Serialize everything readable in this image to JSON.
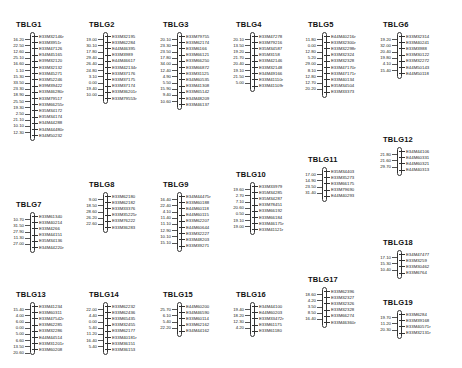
{
  "groups": [
    {
      "name": "TBLG1",
      "x": 30,
      "y": 22,
      "markers": [
        "E33M32146r",
        "E33M3951r",
        "E33M47126",
        "E34M45165",
        "E39M32120",
        "E33M32132",
        "E33M45271",
        "E33M52246",
        "E39M39422",
        "E33M46280r",
        "E33M79517",
        "E33M66255r",
        "E35M34172",
        "E35M34174",
        "E34M44288",
        "E34M44480r",
        "E34M50232"
      ],
      "distances": [
        "16.20",
        "22.50",
        "12.60",
        "25.10",
        "16.60",
        "1.10",
        "15.30",
        "33.50",
        "23.30",
        "18.90",
        "25.50",
        "19.30",
        "2.50",
        "21.10",
        "10.10",
        "12.30"
      ]
    },
    {
      "name": "TBLG2",
      "x": 103,
      "y": 22,
      "markers": [
        "E33M32195",
        "E33M62284",
        "E44M46395",
        "E33M3989",
        "E44M46617",
        "E33M42134r",
        "E33M37176",
        "E33M37175",
        "E33M37174",
        "E33M36201r",
        "E33M79553r"
      ],
      "distances": [
        "19.00",
        "30.10",
        "17.80",
        "29.40",
        "26.40",
        "24.80",
        "3.10",
        "0.00",
        "19.40",
        "10.00"
      ]
    },
    {
      "name": "TBLG3",
      "x": 177,
      "y": 22,
      "markers": [
        "E33M79755",
        "E33M62174",
        "E33M6166",
        "E33M66121",
        "E33M66250",
        "E33M66872",
        "E33M31125",
        "E34M60535",
        "E33M41308",
        "E33M65142",
        "E34M48209",
        "E33M46137"
      ],
      "distances": [
        "20.10",
        "23.30",
        "23.50",
        "17.80",
        "34.00",
        "12.40",
        "4.90",
        "5.50",
        "15.90",
        "9.40",
        "10.60"
      ]
    },
    {
      "name": "TBLG4",
      "x": 250,
      "y": 22,
      "markers": [
        "E33M47278",
        "E33M79216",
        "E35M34587",
        "E35M3158",
        "E33M42146",
        "E33M32148",
        "E34M49166",
        "E33M41110r",
        "E33M41109r"
      ],
      "distances": [
        "20.10",
        "13.50",
        "19.20",
        "21.70",
        "20.40",
        "19.10",
        "21.50",
        "5.00"
      ]
    },
    {
      "name": "TBLG5",
      "x": 322,
      "y": 22,
      "markers": [
        "E44M40216r",
        "E33M32300r",
        "E33M32298r",
        "E33M32324",
        "E33M32328",
        "E33M47170r",
        "E33M47171r",
        "E33M40134",
        "E35M34504",
        "E33M33373"
      ],
      "distances": [
        "11.80",
        "0.00",
        "12.80",
        "5.20",
        "29.00",
        "8.10",
        "12.80",
        "12.70",
        "20.20"
      ]
    },
    {
      "name": "TBLG6",
      "x": 397,
      "y": 22,
      "markers": [
        "E33M32314",
        "E33M40241",
        "E33M3988",
        "E33M30122",
        "E33M32272",
        "E44M50143",
        "E44M50118"
      ],
      "distances": [
        "19.20",
        "32.00",
        "20.40",
        "19.80",
        "4.10",
        "15.40"
      ]
    },
    {
      "name": "TBLG7",
      "x": 30,
      "y": 202,
      "markers": [
        "E33M61340",
        "E33M40214",
        "E33M4266",
        "E33M44151",
        "E35M34136",
        "E34M44220r"
      ],
      "distances": [
        "10.70",
        "31.50",
        "27.90",
        "11.30",
        "27.00"
      ]
    },
    {
      "name": "TBLG8",
      "x": 103,
      "y": 182,
      "markers": [
        "E33M62180",
        "E33M62182",
        "E33M33376",
        "E33M35225r",
        "E33M76222",
        "E33M36283"
      ],
      "distances": [
        "9.00",
        "18.50",
        "28.60",
        "26.20",
        "22.60"
      ]
    },
    {
      "name": "TBLG9",
      "x": 177,
      "y": 182,
      "markers": [
        "E34M44475r",
        "E33M60188",
        "E44M60118",
        "E44M60115",
        "E33M62207",
        "E44M60644",
        "E33M32227",
        "E33M48203",
        "E33M39271"
      ],
      "distances": [
        "16.40",
        "22.40",
        "4.10",
        "11.40",
        "11.10",
        "12.90",
        "10.10",
        "15.10"
      ]
    },
    {
      "name": "TBLG10",
      "x": 250,
      "y": 172,
      "markers": [
        "E33M33979",
        "E35M34285",
        "E35M34287",
        "E33M78451",
        "E33M66192",
        "E33M66184",
        "E33M46175r",
        "E33M41121r"
      ],
      "distances": [
        "19.60",
        "2.70",
        "7.10",
        "20.60",
        "0.50",
        "19.10",
        "19.00"
      ]
    },
    {
      "name": "TBLG11",
      "x": 322,
      "y": 157,
      "markers": [
        "E35M34403",
        "E33M35273",
        "E33M66175",
        "E33M79690",
        "E44M40293"
      ],
      "distances": [
        "17.00",
        "14.90",
        "23.50",
        "31.40"
      ]
    },
    {
      "name": "TBLG12",
      "x": 397,
      "y": 137,
      "markers": [
        "E34M44106",
        "E44M60331",
        "E44M60321",
        "E44M40313"
      ],
      "distances": [
        "21.80",
        "21.60",
        "29.70"
      ]
    },
    {
      "name": "TBLG13",
      "x": 30,
      "y": 292,
      "markers": [
        "E33M41234",
        "E33M60311",
        "E33M47542r",
        "E33M62285",
        "E33M32286",
        "E44M44514",
        "E33M31201r",
        "E33M60208"
      ],
      "distances": [
        "15.40",
        "4.00",
        "6.00",
        "0.00",
        "5.00",
        "6.60",
        "13.50",
        "20.60"
      ]
    },
    {
      "name": "TBLG14",
      "x": 103,
      "y": 292,
      "markers": [
        "E33M62232",
        "E33M62436",
        "E33M65435",
        "E33M32455",
        "E33M62177",
        "E33M40181r",
        "E33M36151",
        "E33M36153"
      ],
      "distances": [
        "22.00",
        "4.40",
        "0.00",
        "5.40",
        "11.20",
        "16.40",
        "5.40"
      ]
    },
    {
      "name": "TBLG15",
      "x": 177,
      "y": 292,
      "markers": [
        "E44M60200",
        "E34M46590",
        "E33M60114",
        "E33M62162",
        "E34M44162"
      ],
      "distances": [
        "25.70",
        "6.10",
        "5.40",
        "22.20"
      ]
    },
    {
      "name": "TBLG16",
      "x": 250,
      "y": 292,
      "markers": [
        "E34M44100",
        "E44M60203",
        "E33M33472r",
        "E33M61175",
        "E33M61180"
      ],
      "distances": [
        "19.40",
        "18.20",
        "12.30",
        "4.20"
      ]
    },
    {
      "name": "TBLG17",
      "x": 322,
      "y": 277,
      "markers": [
        "E33M62396",
        "E33M32327",
        "E33M32326",
        "E33M32328",
        "E33M66274",
        "E33M46360r"
      ],
      "distances": [
        "18.60",
        "4.20",
        "3.50",
        "8.50",
        "16.40"
      ]
    },
    {
      "name": "TBLG18",
      "x": 397,
      "y": 240,
      "markers": [
        "E34M47477",
        "E33M3259",
        "E33M30462",
        "E33M6764"
      ],
      "distances": [
        "17.10",
        "15.30",
        "10.40"
      ]
    },
    {
      "name": "TBLG19",
      "x": 397,
      "y": 300,
      "markers": [
        "E33M6284",
        "E33M39168",
        "E33M40571r",
        "E33M32131r"
      ],
      "distances": [
        "19.70",
        "11.20",
        "20.30"
      ]
    }
  ]
}
